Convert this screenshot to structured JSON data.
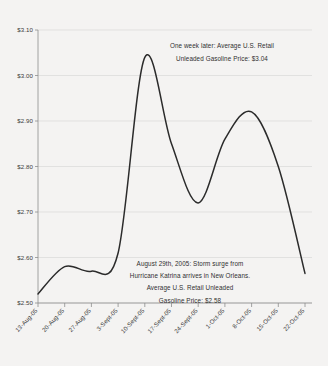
{
  "chart_data": {
    "type": "line",
    "title": "",
    "subtitle": "",
    "xlabel": "",
    "ylabel": "",
    "ylim": [
      2.5,
      3.1
    ],
    "ytick_labels": [
      "$3.10",
      "$3.00",
      "$2.90",
      "$2.80",
      "$2.70",
      "$2.60",
      "$2.50"
    ],
    "ytick_values": [
      3.1,
      3.0,
      2.9,
      2.8,
      2.7,
      2.6,
      2.5
    ],
    "categories": [
      "13-Aug-05",
      "20-Aug-05",
      "27-Aug-05",
      "3-Sept-05",
      "10-Sept-05",
      "17-Sept-05",
      "24-Sept-05",
      "1-Oct-05",
      "8-Oct-05",
      "15-Oct-05",
      "22-Oct-05"
    ],
    "series": [
      {
        "name": "Average U.S. Retail Unleaded Gasoline Price",
        "values": [
          2.52,
          2.58,
          2.57,
          2.61,
          3.04,
          2.85,
          2.72,
          2.86,
          2.92,
          2.8,
          2.565
        ]
      }
    ],
    "grid": true,
    "legend_position": "none",
    "line_color": "#2b2b2b",
    "grid_color": "#d8d8d8",
    "axis_color": "#8d8d8d",
    "background_color": "#f4f3f2",
    "annotations": [
      {
        "id": "peak-annotation",
        "lines": [
          "One week later: Average U.S. Retail",
          "Unleaded Gasoline Price: $3.04"
        ]
      },
      {
        "id": "katrina-annotation",
        "lines": [
          "August 29th, 2005: Storm surge from",
          "Hurricane Katrina arrives in New Orleans.",
          "Average U.S. Retail Unleaded",
          "Gasoline Price: $2.58"
        ]
      }
    ]
  }
}
